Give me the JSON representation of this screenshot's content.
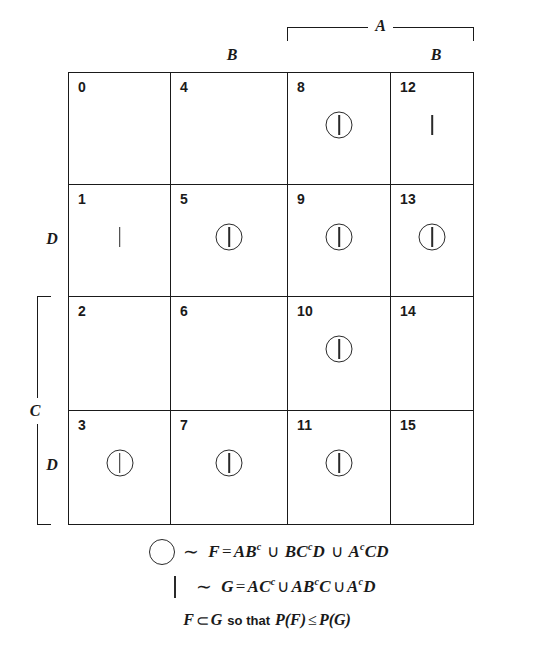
{
  "figure": {
    "type": "karnaugh-map",
    "title": ""
  },
  "axis_labels": {
    "top_bracket": "A",
    "top_b_left": "B",
    "top_b_right": "B",
    "left_bracket": "C",
    "left_d_upper": "D",
    "left_d_lower": "D"
  },
  "grid": {
    "columns": 4,
    "rows": 4,
    "cells": [
      {
        "index": "0",
        "circle": false,
        "bar": false
      },
      {
        "index": "4",
        "circle": false,
        "bar": false
      },
      {
        "index": "8",
        "circle": true,
        "bar": true
      },
      {
        "index": "12",
        "circle": false,
        "bar": true
      },
      {
        "index": "1",
        "circle": false,
        "bar": true
      },
      {
        "index": "5",
        "circle": true,
        "bar": true
      },
      {
        "index": "9",
        "circle": true,
        "bar": true
      },
      {
        "index": "13",
        "circle": true,
        "bar": true
      },
      {
        "index": "2",
        "circle": false,
        "bar": false
      },
      {
        "index": "6",
        "circle": false,
        "bar": false
      },
      {
        "index": "10",
        "circle": true,
        "bar": true
      },
      {
        "index": "14",
        "circle": false,
        "bar": false
      },
      {
        "index": "3",
        "circle": true,
        "bar": true
      },
      {
        "index": "7",
        "circle": true,
        "bar": true
      },
      {
        "index": "11",
        "circle": true,
        "bar": true
      },
      {
        "index": "15",
        "circle": false,
        "bar": false
      }
    ]
  },
  "legend": {
    "line1": {
      "symbol": "circle",
      "tilde": "∼",
      "expr_head": "F",
      "expr_eq": "=",
      "terms": [
        {
          "base": "AB",
          "sup": "c",
          "tail": ""
        },
        {
          "base": "BC",
          "sup": "c",
          "tail": "D"
        },
        {
          "base": "A",
          "sup": "c",
          "tail": "CD"
        }
      ],
      "union": "∪",
      "full_text": "○ ∼ F = ABᶜ ∪ BCᶜD ∪ AᶜCD"
    },
    "line2": {
      "symbol": "bar",
      "tilde": "∼",
      "expr_head": "G",
      "expr_eq": "=",
      "terms": [
        {
          "base": "AC",
          "sup": "c",
          "tail": ""
        },
        {
          "base": "AB",
          "sup": "c",
          "tail": "C"
        },
        {
          "base": "A",
          "sup": "c",
          "tail": "D"
        }
      ],
      "union": "∪",
      "full_text": "| ∼ G = ACᶜ ∪ ABᶜC ∪ AᶜD"
    },
    "conclusion": {
      "lhs": "F",
      "subset": "⊂",
      "rhs": "G",
      "middle": "so that",
      "prob_left": "P(F)",
      "leq": "≤",
      "prob_right": "P(G)",
      "full_text": "F ⊂ G so that P(F) ≤ P(G)"
    }
  },
  "colors": {
    "ink": "#1a1a1a",
    "paper": "#ffffff"
  }
}
